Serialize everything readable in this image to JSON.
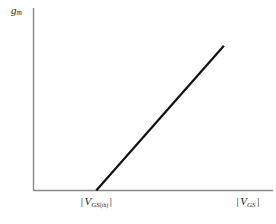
{
  "figure": {
    "name": "mosfet-transconductance-characteristic",
    "background": "#ffffff"
  },
  "axes": {
    "color": "#8a8a8a",
    "y_axis": {
      "label_var": "g",
      "label_sub": "m",
      "name": "transconductance"
    },
    "x_axis": {
      "label_bar_open": "|",
      "label_var": "V",
      "label_sub": "GS",
      "label_bar_close": "|",
      "name": "gate-source-voltage-magnitude"
    }
  },
  "annotations": {
    "threshold": {
      "bar_open": "|",
      "var": "V",
      "sub": "GS",
      "subsub": "(th)",
      "bar_close": "|",
      "name": "threshold-voltage-magnitude"
    }
  },
  "chart_data": {
    "type": "line",
    "title": "",
    "xlabel": "| V_GS |",
    "ylabel": "g_m",
    "grid": false,
    "legend": null,
    "series": [
      {
        "name": "transconductance",
        "color": "#111111",
        "line_width": 2.2,
        "x": [
          0.262,
          0.795
        ],
        "y": [
          0.0,
          0.793
        ],
        "comment": "normalized plot-area coordinates; line begins at threshold on x-axis and rises linearly"
      }
    ],
    "xlim": [
      0,
      1
    ],
    "ylim": [
      0,
      1
    ],
    "x_markers": [
      {
        "label": "| V_GS(th) |",
        "x": 0.262
      }
    ]
  }
}
